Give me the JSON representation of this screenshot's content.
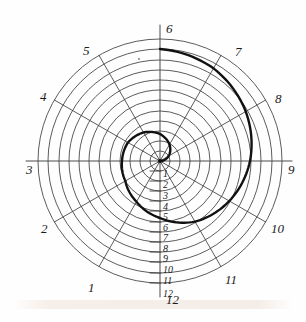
{
  "figure": {
    "type": "archimedean-spiral-construction",
    "title_visible": "",
    "center": {
      "x": 160,
      "y": 161
    },
    "outer_radius": 122,
    "circle_count": 12,
    "spoke_count": 12,
    "spoke_angle_step_degrees": 30,
    "line_color": "#3a3a3a",
    "spiral_color": "#111111",
    "background_color": "#fefefe"
  },
  "perimeter_labels": [
    {
      "id": "1",
      "text": "1",
      "x": 88,
      "y": 281,
      "angle_degrees": 240
    },
    {
      "id": "2",
      "text": "2",
      "x": 41,
      "y": 222,
      "angle_degrees": 210
    },
    {
      "id": "3",
      "text": "3",
      "x": 26,
      "y": 163,
      "angle_degrees": 180
    },
    {
      "id": "4",
      "text": "4",
      "x": 40,
      "y": 90,
      "angle_degrees": 150
    },
    {
      "id": "5",
      "text": "5",
      "x": 83,
      "y": 44,
      "angle_degrees": 120
    },
    {
      "id": "6",
      "text": "6",
      "x": 166,
      "y": 22,
      "angle_degrees": 90
    },
    {
      "id": "7",
      "text": "7",
      "x": 235,
      "y": 45,
      "angle_degrees": 60
    },
    {
      "id": "8",
      "text": "8",
      "x": 275,
      "y": 92,
      "angle_degrees": 30
    },
    {
      "id": "9",
      "text": "9",
      "x": 288,
      "y": 163,
      "angle_degrees": 0
    },
    {
      "id": "10",
      "text": "10",
      "x": 271,
      "y": 222,
      "angle_degrees": 330
    },
    {
      "id": "11",
      "text": "11",
      "x": 225,
      "y": 273,
      "angle_degrees": 300
    },
    {
      "id": "12",
      "text": "12",
      "x": 166,
      "y": 293,
      "angle_degrees": 270
    }
  ],
  "radius_tick_labels": [
    {
      "id": "t1",
      "text": "1",
      "x": 163,
      "y": 169
    },
    {
      "id": "t2",
      "text": "2",
      "x": 163,
      "y": 180
    },
    {
      "id": "t3",
      "text": "3",
      "x": 163,
      "y": 191
    },
    {
      "id": "t4",
      "text": "4",
      "x": 163,
      "y": 202
    },
    {
      "id": "t5",
      "text": "5",
      "x": 163,
      "y": 212
    },
    {
      "id": "t6",
      "text": "6",
      "x": 163,
      "y": 223
    },
    {
      "id": "t7",
      "text": "7",
      "x": 163,
      "y": 233
    },
    {
      "id": "t8",
      "text": "8",
      "x": 163,
      "y": 244
    },
    {
      "id": "t9",
      "text": "9",
      "x": 163,
      "y": 254
    },
    {
      "id": "t10",
      "text": "10",
      "x": 163,
      "y": 265
    },
    {
      "id": "t11",
      "text": "11",
      "x": 163,
      "y": 276
    },
    {
      "id": "t12",
      "text": "12",
      "x": 163,
      "y": 289
    }
  ],
  "chart_data": {
    "type": "line",
    "title": "",
    "xlabel": "",
    "ylabel": "",
    "polar_grid": {
      "radii": [
        10,
        20,
        30,
        40,
        50,
        61,
        71,
        81,
        91,
        101,
        112,
        122
      ],
      "spoke_angles_degrees": [
        0,
        30,
        60,
        90,
        120,
        150,
        180,
        210,
        240,
        270,
        300,
        330
      ]
    },
    "spiral": {
      "name": "spiral-curve",
      "theta_start_degrees": 0,
      "theta_end_degrees": 450,
      "r_start": 0,
      "r_end": 112,
      "sampled_points_polar": [
        {
          "theta_degrees": 0,
          "r": 0
        },
        {
          "theta_degrees": 30,
          "r": 10
        },
        {
          "theta_degrees": 60,
          "r": 19
        },
        {
          "theta_degrees": 90,
          "r": 27
        },
        {
          "theta_degrees": 120,
          "r": 33
        },
        {
          "theta_degrees": 150,
          "r": 37
        },
        {
          "theta_degrees": 180,
          "r": 38
        },
        {
          "theta_degrees": 210,
          "r": 40
        },
        {
          "theta_degrees": 240,
          "r": 47
        },
        {
          "theta_degrees": 270,
          "r": 57
        },
        {
          "theta_degrees": 300,
          "r": 70
        },
        {
          "theta_degrees": 330,
          "r": 80
        },
        {
          "theta_degrees": 360,
          "r": 90
        },
        {
          "theta_degrees": 390,
          "r": 99
        },
        {
          "theta_degrees": 420,
          "r": 107
        },
        {
          "theta_degrees": 450,
          "r": 112
        }
      ]
    }
  }
}
